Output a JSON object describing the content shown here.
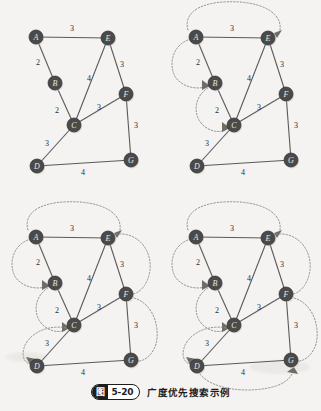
{
  "figure": {
    "caption_prefix_char": "图",
    "caption_number": "5-20",
    "caption_text": "广度优先搜索示例",
    "background_color": "#f4f3f1",
    "node_fill_color": "#4a4a4a",
    "node_text_color": "#e8e6e2",
    "edge_color": "#5a5a5a",
    "arc_color": "#8d8a85"
  },
  "graph": {
    "nodes": [
      {
        "id": "A",
        "label": "A",
        "x": 36,
        "y": 37
      },
      {
        "id": "B",
        "label": "B",
        "x": 55,
        "y": 83
      },
      {
        "id": "C",
        "label": "C",
        "x": 74,
        "y": 125
      },
      {
        "id": "D",
        "label": "D",
        "x": 37,
        "y": 166
      },
      {
        "id": "E",
        "label": "E",
        "x": 108,
        "y": 38
      },
      {
        "id": "F",
        "label": "F",
        "x": 126,
        "y": 94
      },
      {
        "id": "G",
        "label": "G",
        "x": 131,
        "y": 160
      }
    ],
    "edges": [
      {
        "from": "A",
        "to": "E",
        "weight": "3",
        "lx": 72,
        "ly": 28
      },
      {
        "from": "A",
        "to": "B",
        "weight": "2",
        "lx": 38,
        "ly": 62
      },
      {
        "from": "B",
        "to": "C",
        "weight": "2",
        "lx": 57,
        "ly": 110
      },
      {
        "from": "E",
        "to": "C",
        "weight": "4",
        "lx": 89,
        "ly": 78
      },
      {
        "from": "E",
        "to": "F",
        "weight": "3",
        "lx": 122,
        "ly": 64
      },
      {
        "from": "C",
        "to": "F",
        "weight": "3",
        "lx": 99,
        "ly": 107
      },
      {
        "from": "C",
        "to": "D",
        "weight": "3",
        "lx": 47,
        "ly": 143
      },
      {
        "from": "F",
        "to": "G",
        "weight": "3",
        "lx": 136,
        "ly": 125
      },
      {
        "from": "D",
        "to": "G",
        "weight": "4",
        "lx": 83,
        "ly": 172
      }
    ]
  },
  "panels": [
    {
      "name": "panel-step-1",
      "index": 1,
      "x": 0,
      "y": 0,
      "arcs": []
    },
    {
      "name": "panel-step-2",
      "index": 2,
      "x": 160,
      "y": 0,
      "arcs": [
        "A-E",
        "A-B",
        "B-C"
      ]
    },
    {
      "name": "panel-step-3",
      "index": 3,
      "x": 0,
      "y": 200,
      "arcs": [
        "A-E",
        "A-B",
        "B-C",
        "C-D",
        "E-F",
        "F-G"
      ]
    },
    {
      "name": "panel-step-4",
      "index": 4,
      "x": 160,
      "y": 200,
      "arcs": [
        "A-E",
        "A-B",
        "B-C",
        "C-D",
        "E-F",
        "F-G",
        "D-G"
      ]
    }
  ],
  "arc_paths": {
    "A-E": {
      "d": "M 28 30 C 22 8 50 0 80 2 C 105 4 122 14 120 30",
      "head": [
        114,
        33,
        122,
        30,
        117,
        38
      ]
    },
    "A-B": {
      "d": "M 28 40 C 12 46 8 66 16 78 C 24 88 38 90 48 86",
      "head": [
        42,
        80,
        50,
        86,
        42,
        90
      ]
    },
    "B-C": {
      "d": "M 48 88 C 34 96 32 116 44 126 C 54 134 64 132 68 128",
      "head": [
        62,
        122,
        70,
        128,
        62,
        132
      ]
    },
    "C-D": {
      "d": "M 66 128 C 48 124 28 134 24 148 C 21 158 26 164 31 164",
      "head": [
        26,
        157,
        30,
        165,
        36,
        159
      ]
    },
    "E-F": {
      "d": "M 116 34 C 140 32 152 52 150 70 C 148 86 138 94 132 94",
      "head": [
        126,
        88,
        134,
        94,
        126,
        99
      ]
    },
    "F-G": {
      "d": "M 134 98 C 154 104 160 128 156 144 C 152 157 142 162 137 161",
      "head": [
        131,
        155,
        139,
        161,
        131,
        166
      ]
    },
    "D-G": {
      "d": "M 40 174 C 52 190 90 194 116 186 C 128 182 134 174 133 168",
      "head": [
        127,
        172,
        134,
        167,
        138,
        174
      ]
    }
  }
}
